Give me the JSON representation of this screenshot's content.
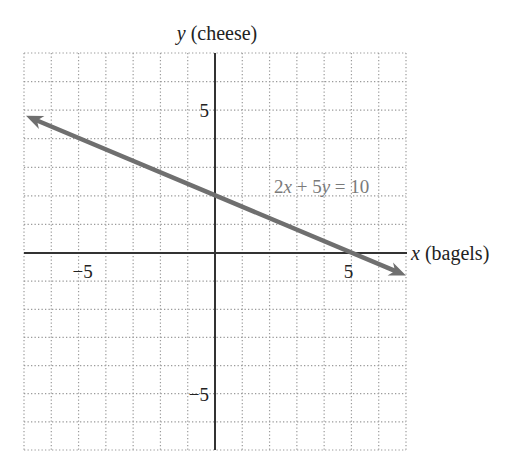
{
  "chart_data": {
    "type": "line",
    "title": "",
    "xlabel_var": "x",
    "xlabel_text": " (bagels)",
    "ylabel_var": "y",
    "ylabel_text": " (cheese)",
    "xlim": [
      -7,
      7
    ],
    "ylim": [
      -7,
      7
    ],
    "grid": true,
    "grid_style": "dotted",
    "x_ticks_labeled": [
      -5,
      5
    ],
    "y_ticks_labeled": [
      5,
      -5
    ],
    "tick_labels": {
      "x_neg5": "−5",
      "x_pos5": "5",
      "y_pos5": "5",
      "y_neg5": "−5"
    },
    "series": [
      {
        "name": "2x + 5y = 10",
        "equation": "2x + 5y = 10",
        "slope": -0.4,
        "intercept": 2,
        "x": [
          -7,
          7
        ],
        "y": [
          4.8,
          -0.8
        ],
        "arrows": "both",
        "color": "#6f6f6f"
      }
    ],
    "annotation": {
      "parts": [
        "2",
        "x",
        " + 5",
        "y",
        " = 10"
      ],
      "position": {
        "x": 2.2,
        "y": 2.3
      }
    }
  },
  "colors": {
    "axis": "#333333",
    "grid": "#9a9a9a",
    "line": "#6f6f6f",
    "equation_text": "#7a7a7a"
  }
}
